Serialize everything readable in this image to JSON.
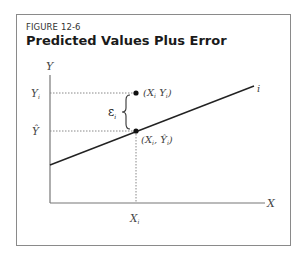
{
  "figure": {
    "number": "FIGURE 12-6",
    "title": "Predicted Values Plus Error"
  },
  "axes": {
    "y_label": "Y",
    "x_label": "X"
  },
  "labels": {
    "y_i": "Y",
    "y_i_sub": "i",
    "y_hat": "Ŷ",
    "x_i": "X",
    "x_i_sub": "i",
    "epsilon": "ε",
    "epsilon_sub": "i",
    "line_label": "i",
    "point_actual": "(X",
    "point_actual_sub1": "i",
    "point_actual_mid": " Y",
    "point_actual_sub2": "i",
    "point_actual_end": ")",
    "point_pred": "(X",
    "point_pred_sub1": "i",
    "point_pred_mid": ", Ŷ",
    "point_pred_sub2": "i",
    "point_pred_end": ")"
  },
  "colors": {
    "line": "#222222",
    "axis": "#777777",
    "dotted": "#888888",
    "point": "#111111"
  }
}
